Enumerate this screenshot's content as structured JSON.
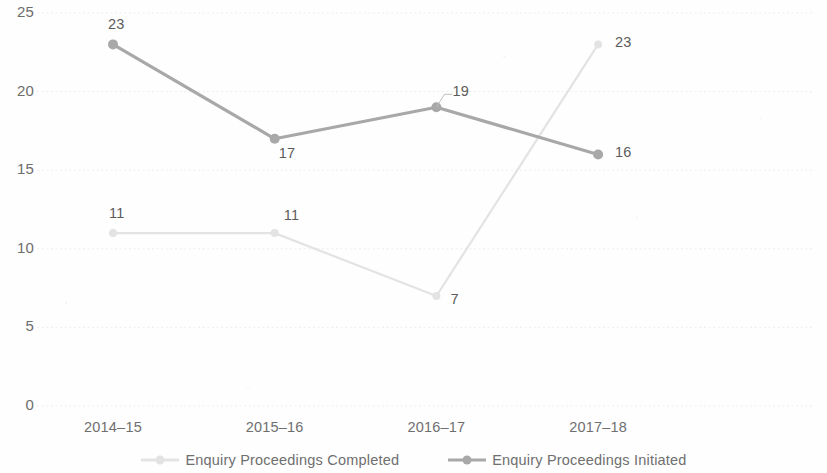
{
  "chart_data": {
    "type": "line",
    "title": "",
    "xlabel": "",
    "ylabel": "",
    "categories": [
      "2014–15",
      "2015–16",
      "2016–17",
      "2017–18"
    ],
    "ylim": [
      0,
      25
    ],
    "yticks": [
      0,
      5,
      10,
      15,
      20,
      25
    ],
    "ytick_labels": [
      "0",
      "5",
      "10",
      "15",
      "20",
      "25"
    ],
    "grid": "horizontal-dotted",
    "legend_position": "bottom-center",
    "series": [
      {
        "name": "Enquiry Proceedings Completed",
        "color": "#e3e3e3",
        "values": [
          11,
          11,
          7,
          23
        ],
        "labels": [
          "11",
          "11",
          "7",
          "23"
        ]
      },
      {
        "name": "Enquiry Proceedings Initiated",
        "color": "#a8a8a8",
        "values": [
          23,
          17,
          19,
          16
        ],
        "labels": [
          "23",
          "17",
          "19",
          "16"
        ]
      }
    ]
  },
  "legend": {
    "items": [
      {
        "label": "Enquiry Proceedings Completed",
        "color": "#e3e3e3"
      },
      {
        "label": "Enquiry Proceedings Initiated",
        "color": "#a8a8a8"
      }
    ]
  },
  "colors": {
    "axis_text": "#6f6f6f",
    "data_label": "#5b5b5b",
    "gridline": "#ededed",
    "series_initiated": "#a8a8a8",
    "series_completed": "#e3e3e3",
    "background": "#fefefe"
  }
}
